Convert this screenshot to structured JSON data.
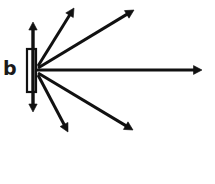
{
  "figure": {
    "panel_label": "b",
    "background_color": "#ffffff",
    "ink_color": "#111111"
  },
  "aperture": {
    "name": "slit-rectangle",
    "x": 27,
    "y": 49,
    "width": 9,
    "height": 43,
    "stroke_width": 2.2,
    "fill": "#ffffff"
  },
  "origin": {
    "x": 36,
    "y": 70
  },
  "chart_data": {
    "type": "scatter",
    "title": "b",
    "xlabel": "",
    "ylabel": "",
    "xlim": [
      0,
      215
    ],
    "ylim": [
      184,
      0
    ],
    "grid": false,
    "legend": null,
    "annotations": [
      "b"
    ],
    "series": [
      {
        "name": "radiating-arrows",
        "points": [
          {
            "label": "arrow-up",
            "x0": 33,
            "y0": 70,
            "x1": 33,
            "y1": 18,
            "angle_deg": 90
          },
          {
            "label": "arrow-up-steep",
            "x0": 36,
            "y0": 66,
            "x1": 76,
            "y1": 3,
            "angle_deg": 58
          },
          {
            "label": "arrow-up-shallow",
            "x0": 36,
            "y0": 68,
            "x1": 138,
            "y1": 5,
            "angle_deg": 32
          },
          {
            "label": "arrow-right",
            "x0": 36,
            "y0": 70,
            "x1": 210,
            "y1": 70,
            "angle_deg": 0
          },
          {
            "label": "arrow-down-shallow",
            "x0": 36,
            "y0": 73,
            "x1": 139,
            "y1": 135,
            "angle_deg": -31
          },
          {
            "label": "arrow-down-steep",
            "x0": 36,
            "y0": 75,
            "x1": 71,
            "y1": 139,
            "angle_deg": -61
          },
          {
            "label": "arrow-down",
            "x0": 33,
            "y0": 70,
            "x1": 33,
            "y1": 118,
            "angle_deg": -90
          }
        ]
      }
    ]
  },
  "arrows": [
    {
      "name": "arrow-up",
      "x1": 33,
      "y1": 70,
      "x2": 33,
      "y2": 22,
      "width": 3.4,
      "head": 8.0
    },
    {
      "name": "arrow-up-steep",
      "x1": 38,
      "y1": 66,
      "x2": 74,
      "y2": 8,
      "width": 3.0,
      "head": 8.5
    },
    {
      "name": "arrow-up-shallow",
      "x1": 38,
      "y1": 68,
      "x2": 134,
      "y2": 10,
      "width": 3.0,
      "head": 8.5
    },
    {
      "name": "arrow-right",
      "x1": 36,
      "y1": 70,
      "x2": 202,
      "y2": 70,
      "width": 3.0,
      "head": 8.5
    },
    {
      "name": "arrow-down-shallow",
      "x1": 38,
      "y1": 73,
      "x2": 133,
      "y2": 130,
      "width": 3.0,
      "head": 8.5
    },
    {
      "name": "arrow-down-steep",
      "x1": 38,
      "y1": 75,
      "x2": 68,
      "y2": 132,
      "width": 3.0,
      "head": 8.5
    },
    {
      "name": "arrow-down",
      "x1": 33,
      "y1": 70,
      "x2": 33,
      "y2": 112,
      "width": 3.4,
      "head": 8.0
    }
  ]
}
